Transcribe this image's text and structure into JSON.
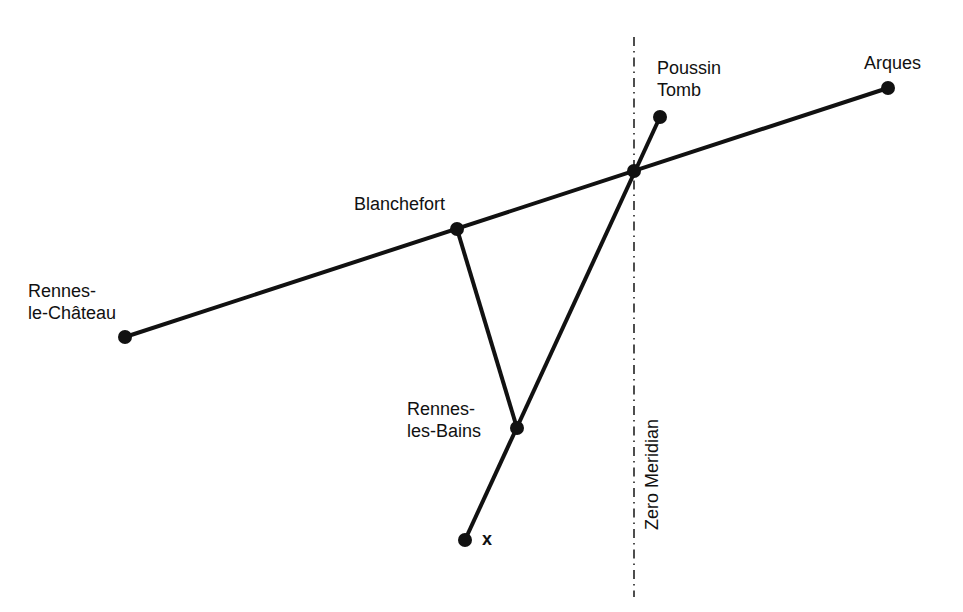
{
  "diagram": {
    "colors": {
      "line": "#111111",
      "background": "#ffffff"
    },
    "points": [
      {
        "id": "rennes-le-chateau",
        "label": "Rennes-\nle-Château",
        "x": 125,
        "y": 337
      },
      {
        "id": "blanchefort",
        "label": "Blanchefort",
        "x": 457,
        "y": 229
      },
      {
        "id": "intersection",
        "label": "",
        "x": 634,
        "y": 171
      },
      {
        "id": "arques",
        "label": "Arques",
        "x": 888,
        "y": 88
      },
      {
        "id": "poussin-tomb",
        "label": "Poussin\nTomb",
        "x": 660,
        "y": 117
      },
      {
        "id": "rennes-les-bains",
        "label": "Rennes-\nles-Bains",
        "x": 517,
        "y": 428
      },
      {
        "id": "x",
        "label": "x",
        "x": 465,
        "y": 540
      }
    ],
    "segments": [
      [
        "rennes-le-chateau",
        "arques"
      ],
      [
        "blanchefort",
        "rennes-les-bains"
      ],
      [
        "x",
        "poussin-tomb"
      ]
    ],
    "meridian": {
      "label": "Zero Meridian",
      "x": 634,
      "y_start": 37,
      "y_end": 597
    },
    "labels": {
      "rennes_le_chateau": "Rennes-\nle-Château",
      "blanchefort": "Blanchefort",
      "arques": "Arques",
      "poussin_tomb": "Poussin\nTomb",
      "rennes_les_bains": "Rennes-\nles-Bains",
      "x": "x",
      "meridian": "Zero Meridian"
    }
  }
}
